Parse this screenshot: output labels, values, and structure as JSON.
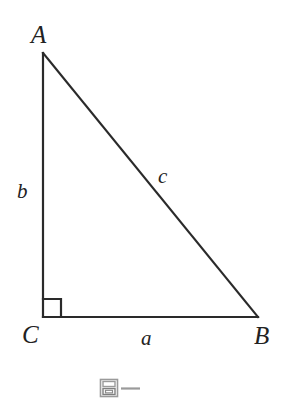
{
  "figure": {
    "type": "right-triangle-diagram",
    "background_color": "#ffffff",
    "stroke_color": "#2a2a2a",
    "stroke_width": 2,
    "vertices": [
      {
        "name": "A",
        "label": "A",
        "x": 43,
        "y": 53
      },
      {
        "name": "B",
        "label": "B",
        "x": 258,
        "y": 317
      },
      {
        "name": "C",
        "label": "C",
        "x": 43,
        "y": 317
      }
    ],
    "sides": [
      {
        "name": "a",
        "label": "a",
        "from": "C",
        "to": "B",
        "description": "base-side-opposite-A"
      },
      {
        "name": "b",
        "label": "b",
        "from": "C",
        "to": "A",
        "description": "vertical-side-opposite-B"
      },
      {
        "name": "c",
        "label": "c",
        "from": "A",
        "to": "B",
        "description": "hypotenuse-opposite-C"
      }
    ],
    "right_angle": {
      "at_vertex": "C",
      "marker": "square",
      "size": 18
    },
    "artifact": {
      "name": "scan-artifact",
      "glyph": "nested-square-box-with-dash",
      "color": "#8f8f8f"
    }
  }
}
